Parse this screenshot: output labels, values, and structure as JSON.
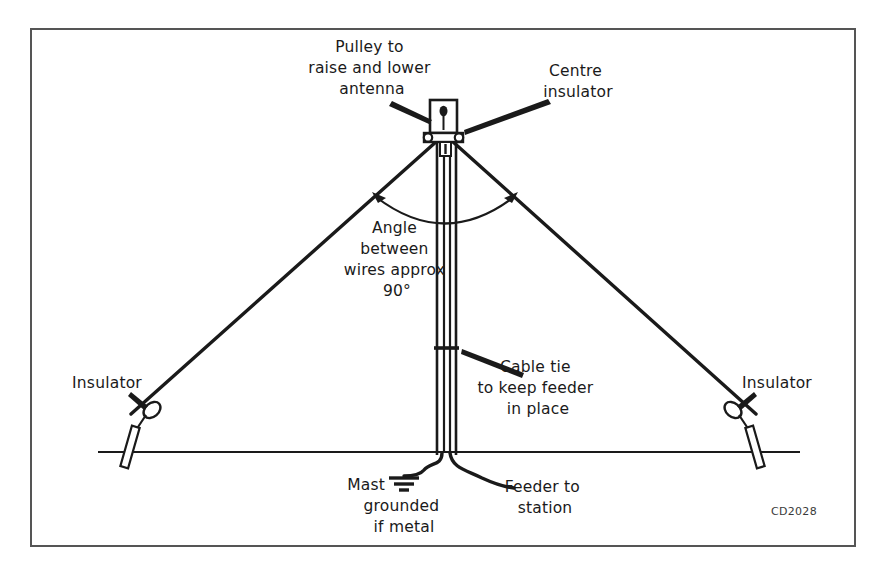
{
  "figure": {
    "title_code": "CD2028",
    "frame": {
      "x": 31,
      "y": 29,
      "width": 824,
      "height": 517
    },
    "colors": {
      "ink": "#1a1a1a",
      "frame": "#555555",
      "background": "#ffffff",
      "label_text": "#1a1a1a",
      "code_text": "#3a3a3a"
    }
  },
  "labels": {
    "pulley": {
      "lines": [
        "Pulley to",
        "raise and lower",
        "antenna"
      ],
      "anchor_x": 372,
      "anchor_y": 52,
      "line_height": 21,
      "align": "middle"
    },
    "centre_insulator": {
      "lines": [
        "Centre",
        "insulator"
      ],
      "anchor_x": 578,
      "anchor_y": 76,
      "line_height": 21,
      "align": "middle"
    },
    "angle": {
      "lines": [
        "Angle",
        "between",
        "wires approx",
        "90°"
      ],
      "anchor_x": 397,
      "anchor_y": 233,
      "line_height": 21,
      "align": "middle"
    },
    "cable_tie": {
      "lines": [
        "Cable tie",
        "to keep feeder",
        "in place"
      ],
      "anchor_x": 538,
      "anchor_y": 372,
      "line_height": 21,
      "align": "middle"
    },
    "insulator_left": {
      "lines": [
        "Insulator"
      ],
      "anchor_x": 107,
      "anchor_y": 388,
      "line_height": 21,
      "align": "middle"
    },
    "insulator_right": {
      "lines": [
        "Insulator"
      ],
      "anchor_x": 777,
      "anchor_y": 388,
      "line_height": 21,
      "align": "middle"
    },
    "mast_grounded": {
      "lines": [
        "Mast",
        "grounded",
        "if metal"
      ],
      "anchor_x": 404,
      "anchor_y": 492,
      "line_height": 21,
      "align": "middle",
      "ground_symbol": "earth-ground"
    },
    "feeder": {
      "lines": [
        "Feeder to",
        "station"
      ],
      "anchor_x": 545,
      "anchor_y": 492,
      "line_height": 21,
      "align": "middle"
    }
  },
  "geometry": {
    "mast": {
      "x": 443,
      "top_y": 100,
      "bottom_y": 455,
      "half_width": 6
    },
    "feeder": {
      "left_x": 440,
      "right_y": 455,
      "half_width": 2.5
    },
    "ground_line": {
      "x1": 98,
      "x2": 800,
      "y": 452
    },
    "antenna_wire_left": {
      "x1": 437,
      "y1": 140,
      "x2": 130,
      "y2": 415
    },
    "antenna_wire_right": {
      "x1": 452,
      "y1": 140,
      "x2": 757,
      "y2": 415
    },
    "angle_arc": {
      "cx": 445,
      "cy": 142,
      "radius": 78,
      "start_deg": 225,
      "end_deg": 315
    },
    "cable_tie_y": 348,
    "pulley_box": {
      "x": 430,
      "y": 100,
      "w": 26,
      "h": 34
    },
    "insulator_left_oval": {
      "cx": 152,
      "cy": 410,
      "rx": 9,
      "ry": 6.5
    },
    "insulator_right_oval": {
      "cx": 732,
      "cy": 410,
      "rx": 9,
      "ry": 6.5
    }
  },
  "annotations": {
    "leaders": [
      {
        "name": "leader-pulley",
        "from_x": 395,
        "from_y": 104,
        "to_x": 430,
        "to_y": 119
      },
      {
        "name": "leader-centre-insulator",
        "from_x": 545,
        "from_y": 102,
        "to_x": 462,
        "to_y": 132
      },
      {
        "name": "leader-cable-tie",
        "from_x": 522,
        "from_y": 372,
        "to_x": 460,
        "to_y": 350
      },
      {
        "name": "leader-insulator-left",
        "from_x": 133,
        "from_y": 395,
        "to_x": 149,
        "to_y": 407
      },
      {
        "name": "leader-insulator-right",
        "from_x": 757,
        "from_y": 395,
        "to_x": 741,
        "to_y": 407
      }
    ]
  }
}
